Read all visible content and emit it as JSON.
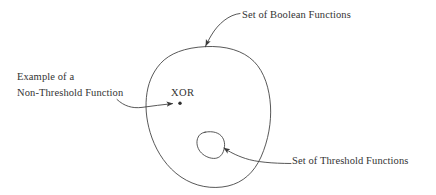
{
  "diagram": {
    "stroke_color": "#3a3a3a",
    "text_color": "#333333",
    "background_color": "#ffffff",
    "labels": {
      "boolean_set": "Set of Boolean Functions",
      "threshold_set": "Set of Threshold Functions",
      "example_line1": "Example of a",
      "example_line2": "Non-Threshold Function",
      "xor_point": "XOR"
    },
    "shapes": {
      "outer_blob_name": "set-of-boolean-functions-region",
      "inner_blob_name": "set-of-threshold-functions-region",
      "point_name": "xor-point-marker"
    },
    "annotations": [
      {
        "name": "boolean-set-leader",
        "target": "outer blob upper boundary",
        "arrow": true
      },
      {
        "name": "threshold-set-leader",
        "target": "inner blob lower-right boundary",
        "arrow": true
      },
      {
        "name": "xor-example-leader",
        "target": "XOR point inside outer blob",
        "arrow": true
      }
    ]
  }
}
